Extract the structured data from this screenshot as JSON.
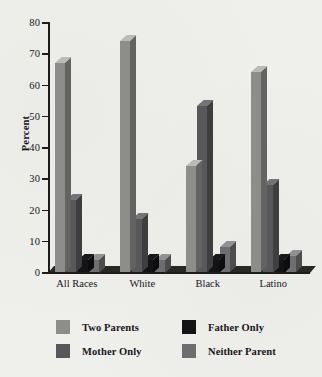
{
  "chart_data": {
    "type": "bar",
    "title": "",
    "xlabel": "",
    "ylabel": "Percent",
    "ylim": [
      0,
      80
    ],
    "yticks": [
      0,
      10,
      20,
      30,
      40,
      50,
      60,
      70,
      80
    ],
    "grid": false,
    "legend_position": "bottom",
    "categories": [
      "All Races",
      "White",
      "Black",
      "Latino"
    ],
    "series": [
      {
        "name": "Two Parents",
        "color": "#8d8d8b",
        "values": [
          67,
          74,
          34,
          64
        ]
      },
      {
        "name": "Mother Only",
        "color": "#58585a",
        "values": [
          23,
          17,
          53,
          28
        ]
      },
      {
        "name": "Father Only",
        "color": "#131316",
        "values": [
          4,
          4,
          4,
          4
        ]
      },
      {
        "name": "Neither Parent",
        "color": "#6e6e70",
        "values": [
          4,
          4,
          8,
          5
        ]
      }
    ]
  },
  "axis": {
    "y_title": "Percent",
    "tick_labels": [
      "0",
      "10",
      "20",
      "30",
      "40",
      "50",
      "60",
      "70",
      "80"
    ],
    "category_labels": [
      "All Races",
      "White",
      "Black",
      "Latino"
    ]
  },
  "legend": {
    "entries": [
      {
        "label": "Two Parents",
        "color": "#8d8d8b"
      },
      {
        "label": "Father Only",
        "color": "#131316"
      },
      {
        "label": "Mother Only",
        "color": "#58585a"
      },
      {
        "label": "Neither Parent",
        "color": "#6e6e70"
      }
    ]
  }
}
